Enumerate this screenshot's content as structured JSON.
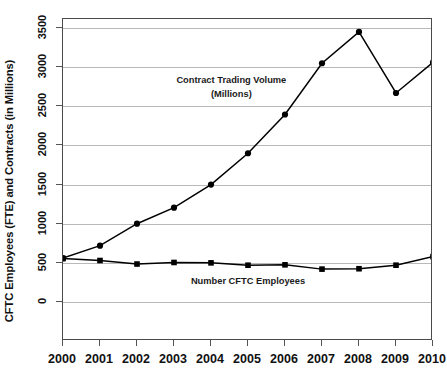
{
  "chart_data": {
    "type": "line",
    "title": "",
    "xlabel": "",
    "ylabel": "CFTC Employees (FTE) and Contracts (in Millions)",
    "x": [
      2000,
      2001,
      2002,
      2003,
      2004,
      2005,
      2006,
      2007,
      2008,
      2009,
      2010
    ],
    "xticklabels": [
      "2000",
      "2001",
      "2002",
      "2003",
      "2004",
      "2005",
      "2006",
      "2007",
      "2008",
      "2009",
      "2010"
    ],
    "yticklabels": [
      "0",
      "500",
      "1000",
      "1500",
      "2000",
      "2500",
      "3000",
      "3500"
    ],
    "yticks": [
      0,
      500,
      1000,
      1500,
      2000,
      2500,
      3000,
      3500
    ],
    "ylim": [
      0,
      3500
    ],
    "xlim": [
      2000,
      2010
    ],
    "grid": "horizontal",
    "legend_position": "inline-annotations",
    "series": [
      {
        "name": "Contract Trading Volume (Millions)",
        "marker": "circle",
        "color": "#000000",
        "values": [
          560,
          720,
          1000,
          1205,
          1500,
          1900,
          2395,
          3050,
          3450,
          2670,
          3060
        ]
      },
      {
        "name": "Number CFTC Employees",
        "marker": "square",
        "color": "#000000",
        "values": [
          555,
          530,
          485,
          505,
          500,
          470,
          475,
          420,
          425,
          470,
          580
        ]
      }
    ],
    "annotations": [
      {
        "id": "volume-annotation",
        "line1": "Contract Trading Volume",
        "line2": "(Millions)"
      },
      {
        "id": "employees-annotation",
        "line1": "Number CFTC Employees",
        "line2": ""
      }
    ]
  }
}
